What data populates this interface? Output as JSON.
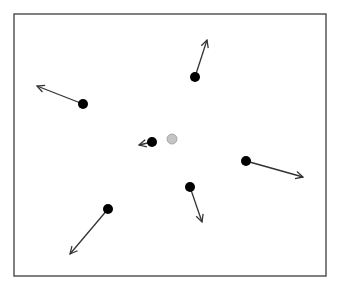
{
  "diagram": {
    "type": "vector-field-points",
    "frame": {
      "x": 14,
      "y": 14,
      "width": 312,
      "height": 262,
      "stroke": "#555555"
    },
    "center_marker": {
      "x": 172,
      "y": 139,
      "r": 5,
      "fill": "#c4c4c4",
      "stroke": "#9a9a9a"
    },
    "point_color": "#000000",
    "arrow_color": "#333333",
    "points": [
      {
        "id": "p1",
        "x": 195,
        "y": 77,
        "r": 5,
        "arrow_to": [
          207,
          40
        ]
      },
      {
        "id": "p2",
        "x": 83,
        "y": 104,
        "r": 5,
        "arrow_to": [
          37,
          86
        ]
      },
      {
        "id": "p3",
        "x": 152,
        "y": 142,
        "r": 5,
        "arrow_to": [
          139,
          145
        ]
      },
      {
        "id": "p4",
        "x": 246,
        "y": 161,
        "r": 5,
        "arrow_to": [
          303,
          177
        ]
      },
      {
        "id": "p5",
        "x": 190,
        "y": 187,
        "r": 5,
        "arrow_to": [
          202,
          222
        ]
      },
      {
        "id": "p6",
        "x": 108,
        "y": 209,
        "r": 5,
        "arrow_to": [
          70,
          254
        ]
      }
    ]
  }
}
